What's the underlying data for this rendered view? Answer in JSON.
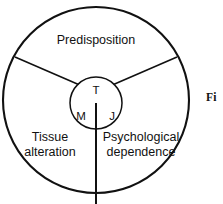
{
  "figure": {
    "title_fragment": "Fi",
    "outer_circle": {
      "cx": 96,
      "cy": 100,
      "r": 93
    },
    "inner_circle": {
      "cx": 96,
      "cy": 103,
      "r": 26
    },
    "sectors": [
      {
        "key": "predisposition",
        "label": "Predisposition",
        "lines": [
          "Predisposition"
        ],
        "x": 96,
        "y": 44
      },
      {
        "key": "tissue-alteration",
        "label": "Tissue alteration",
        "lines": [
          "Tissue",
          "alteration"
        ],
        "x": 50,
        "y": 141
      },
      {
        "key": "psychological-dependence",
        "label": "Psychological dependence",
        "lines": [
          "Psychological",
          "dependence"
        ],
        "x": 140,
        "y": 141
      }
    ],
    "nodes": [
      {
        "key": "t",
        "label": "T",
        "x": 96,
        "y": 90
      },
      {
        "key": "m",
        "label": "M",
        "x": 81,
        "y": 116
      },
      {
        "key": "j",
        "label": "J",
        "x": 112,
        "y": 116
      }
    ],
    "spokes": [
      {
        "key": "upper-left",
        "x1": 78.5,
        "y1": 84.5,
        "x2": 15,
        "y2": 57
      },
      {
        "key": "upper-right",
        "x1": 113.5,
        "y1": 84.5,
        "x2": 177,
        "y2": 57
      },
      {
        "key": "lower-stem",
        "x1": 96,
        "y1": 103,
        "x2": 96,
        "y2": 204
      }
    ],
    "colors": {
      "stroke": "#111111",
      "background": "#ffffff"
    }
  }
}
